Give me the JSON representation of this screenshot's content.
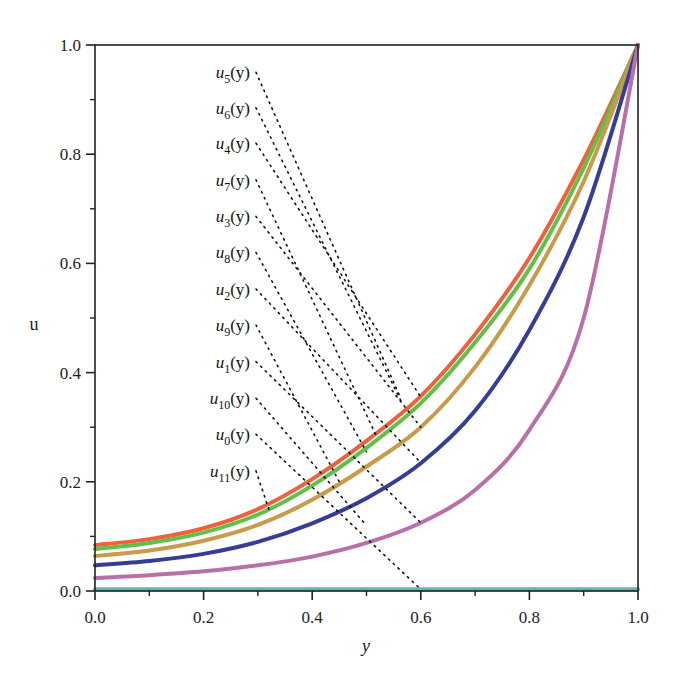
{
  "chart_data": {
    "type": "line",
    "title": "",
    "xlabel": "y",
    "ylabel": "u",
    "xlim": [
      0.0,
      1.0
    ],
    "ylim": [
      0.0,
      1.0
    ],
    "grid": false,
    "x_ticks": [
      "0.0",
      "0.2",
      "0.4",
      "0.6",
      "0.8",
      "1.0"
    ],
    "y_ticks": [
      "0.0",
      "0.2",
      "0.4",
      "0.6",
      "0.8",
      "1.0"
    ],
    "x": [
      0.0,
      0.1,
      0.2,
      0.3,
      0.4,
      0.5,
      0.6,
      0.7,
      0.8,
      0.9,
      1.0
    ],
    "series": [
      {
        "name": "red",
        "color": "#f0603a",
        "values": [
          0.084,
          0.095,
          0.115,
          0.15,
          0.205,
          0.275,
          0.357,
          0.47,
          0.61,
          0.79,
          1.0
        ]
      },
      {
        "name": "green",
        "color": "#62c04a",
        "values": [
          0.077,
          0.088,
          0.107,
          0.14,
          0.193,
          0.262,
          0.344,
          0.455,
          0.59,
          0.775,
          1.0
        ]
      },
      {
        "name": "tan",
        "color": "#c99a4a",
        "values": [
          0.064,
          0.074,
          0.092,
          0.121,
          0.167,
          0.228,
          0.3,
          0.41,
          0.56,
          0.75,
          1.0
        ]
      },
      {
        "name": "blue",
        "color": "#353d96",
        "values": [
          0.047,
          0.055,
          0.068,
          0.09,
          0.124,
          0.17,
          0.234,
          0.33,
          0.478,
          0.685,
          1.0
        ]
      },
      {
        "name": "pink",
        "color": "#b870a8",
        "values": [
          0.024,
          0.029,
          0.036,
          0.047,
          0.063,
          0.088,
          0.125,
          0.185,
          0.295,
          0.5,
          1.0
        ]
      },
      {
        "name": "cyan",
        "color": "#5bb9b0",
        "values": [
          0.003,
          0.003,
          0.003,
          0.003,
          0.003,
          0.003,
          0.003,
          0.003,
          0.003,
          0.003,
          0.003
        ]
      }
    ],
    "annotations": [
      {
        "label": "u",
        "sub": "5",
        "text_y": 0.95,
        "target": [
          0.56,
          0.36
        ]
      },
      {
        "label": "u",
        "sub": "6",
        "text_y": 0.885,
        "target": [
          0.565,
          0.345
        ]
      },
      {
        "label": "u",
        "sub": "4",
        "text_y": 0.82,
        "target": [
          0.6,
          0.355
        ]
      },
      {
        "label": "u",
        "sub": "7",
        "text_y": 0.753,
        "target": [
          0.52,
          0.28
        ]
      },
      {
        "label": "u",
        "sub": "3",
        "text_y": 0.686,
        "target": [
          0.6,
          0.3
        ]
      },
      {
        "label": "u",
        "sub": "8",
        "text_y": 0.62,
        "target": [
          0.5,
          0.255
        ]
      },
      {
        "label": "u",
        "sub": "2",
        "text_y": 0.553,
        "target": [
          0.6,
          0.235
        ]
      },
      {
        "label": "u",
        "sub": "9",
        "text_y": 0.487,
        "target": [
          0.45,
          0.2
        ]
      },
      {
        "label": "u",
        "sub": "1",
        "text_y": 0.42,
        "target": [
          0.6,
          0.125
        ]
      },
      {
        "label": "u",
        "sub": "10",
        "text_y": 0.353,
        "target": [
          0.5,
          0.12
        ]
      },
      {
        "label": "u",
        "sub": "0",
        "text_y": 0.287,
        "target": [
          0.6,
          0.003
        ]
      },
      {
        "label": "u",
        "sub": "11",
        "text_y": 0.22,
        "target": [
          0.32,
          0.15
        ]
      }
    ],
    "legend_position": "none (inline labels with dotted leader lines)"
  }
}
